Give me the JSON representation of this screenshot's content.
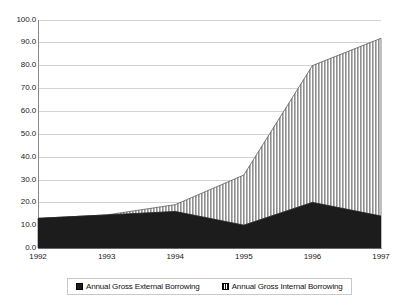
{
  "chart_data": {
    "type": "area",
    "title": "",
    "subtitle": "",
    "xlabel": "",
    "ylabel": "",
    "stacked": true,
    "grid": true,
    "legend_position": "bottom",
    "categories": [
      "1992",
      "1993",
      "1994",
      "1995",
      "1996",
      "1997"
    ],
    "x": [
      1992,
      1993,
      1994,
      1995,
      1996,
      1997
    ],
    "xlim": [
      1992,
      1997
    ],
    "ylim": [
      0.0,
      100.0
    ],
    "yticks": [
      "0.0",
      "10.0",
      "20.0",
      "30.0",
      "40.0",
      "50.0",
      "60.0",
      "70.0",
      "80.0",
      "90.0",
      "100.0"
    ],
    "ytick_values": [
      0,
      10,
      20,
      30,
      40,
      50,
      60,
      70,
      80,
      90,
      100
    ],
    "series": [
      {
        "name": "Annual Gross External Borrowing",
        "pattern": "solid-black",
        "color": "#1c1c1c",
        "values": [
          13.0,
          14.5,
          16.0,
          10.0,
          20.0,
          14.0
        ]
      },
      {
        "name": "Annual Gross Internal Borrowing",
        "pattern": "vertical-hatch",
        "color": "#b0b0b0",
        "values": [
          0.0,
          0.0,
          3.0,
          22.0,
          60.0,
          78.0
        ]
      }
    ],
    "stack_totals": [
      13.0,
      14.5,
      19.0,
      32.0,
      80.0,
      92.0
    ]
  },
  "legend": {
    "entries": [
      {
        "label": "Annual Gross External Borrowing",
        "swatch": "solid-black-swatch"
      },
      {
        "label": "Annual Gross Internal Borrowing",
        "swatch": "hatched-swatch"
      }
    ]
  },
  "axes": {
    "y_labels": [
      "100.0",
      "90.0",
      "80.0",
      "70.0",
      "60.0",
      "50.0",
      "40.0",
      "30.0",
      "20.0",
      "10.0",
      "0.0"
    ],
    "x_labels": [
      "1992",
      "1993",
      "1994",
      "1995",
      "1996",
      "1997"
    ]
  },
  "colors": {
    "gridline": "#d3d3d3",
    "axis": "#8a8a8a",
    "external_fill": "#1c1c1c",
    "internal_fill": "#b0b0b0",
    "background": "#ffffff"
  }
}
